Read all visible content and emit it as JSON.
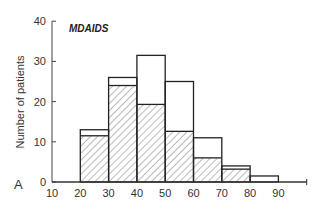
{
  "chart_data": {
    "type": "bar",
    "title": "MDAIDS",
    "panel_label": "A",
    "xlabel": "",
    "ylabel": "Number of patients",
    "x_ticks": [
      10,
      20,
      30,
      40,
      50,
      60,
      70,
      80,
      90
    ],
    "y_ticks": [
      0,
      10,
      20,
      30,
      40
    ],
    "xlim": [
      10,
      100
    ],
    "ylim": [
      0,
      40
    ],
    "grid": false,
    "bins": [
      "20-30",
      "30-40",
      "40-50",
      "50-60",
      "60-70",
      "70-80",
      "80-90"
    ],
    "series": [
      {
        "name": "Total (open bars)",
        "values": [
          13,
          26,
          31.5,
          25,
          11,
          4,
          1.5
        ]
      },
      {
        "name": "Hatched subgroup",
        "values": [
          11.5,
          24,
          19.3,
          12.6,
          6,
          3.2,
          0
        ]
      }
    ],
    "note": "Hatched bars in 20-30 and 30-40 appear as a thin hatched band between subgroup and total tops"
  },
  "labels": {
    "title": "MDAIDS",
    "ylabel": "Number of patients",
    "panel": "A"
  }
}
